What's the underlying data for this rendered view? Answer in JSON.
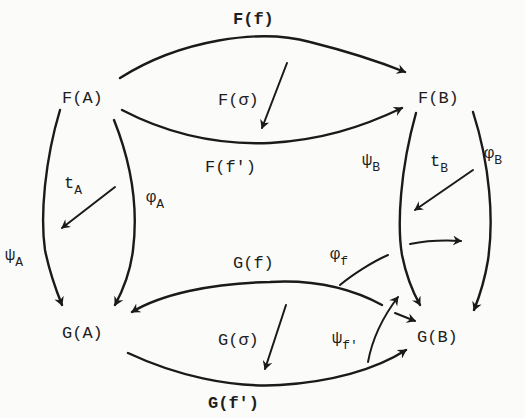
{
  "diagram": {
    "type": "commutative-diagram",
    "objects": {
      "FA": "F(A)",
      "FB": "F(B)",
      "GA": "G(A)",
      "GB": "G(B)"
    },
    "morphisms": {
      "Ff": "F(f)",
      "Ffp": "F(f')",
      "Gf": "G(f)",
      "Gfp": "G(f')",
      "psiA": "ψ",
      "psiA_sub": "A",
      "phiA": "φ",
      "phiA_sub": "A",
      "psiB": "ψ",
      "psiB_sub": "B",
      "phiB": "φ",
      "phiB_sub": "B"
    },
    "two_cells": {
      "Fsigma": "F(σ)",
      "Gsigma": "G(σ)",
      "tA": "t",
      "tA_sub": "A",
      "tB": "t",
      "tB_sub": "B",
      "phif": "φ",
      "phif_sub": "f",
      "psifp": "ψ",
      "psifp_sub": "f'"
    },
    "colors": {
      "ink": "#1a1a1a",
      "paper": "#fbfbf9"
    }
  }
}
